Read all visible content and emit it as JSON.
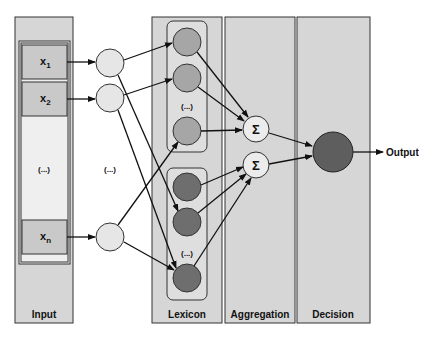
{
  "diagram": {
    "type": "neural-network-architecture",
    "colors": {
      "panel_fill": "#d6d6d6",
      "panel_stroke": "#333333",
      "light_node": "#e6e6e6",
      "mid_node": "#a6a6a6",
      "dark_node": "#6e6e6e",
      "decision_node": "#5e5e5e",
      "input_box": "#c9c9c9",
      "input_inner": "#efefef"
    },
    "panels": [
      {
        "id": "input",
        "label": "Input"
      },
      {
        "id": "lexicon",
        "label": "Lexicon"
      },
      {
        "id": "aggregation",
        "label": "Aggregation"
      },
      {
        "id": "decision",
        "label": "Decision"
      }
    ],
    "inputs": {
      "x1": {
        "base": "x",
        "sub": "1"
      },
      "x2": {
        "base": "x",
        "sub": "2"
      },
      "xn": {
        "base": "x",
        "sub": "n"
      },
      "ellipsis": "(...)"
    },
    "hidden_ellipsis": "(...)",
    "lexicon_ellipsis_top": "(...)",
    "lexicon_ellipsis_bottom": "(...)",
    "sum_symbol": "Σ",
    "output_label": "Output"
  }
}
